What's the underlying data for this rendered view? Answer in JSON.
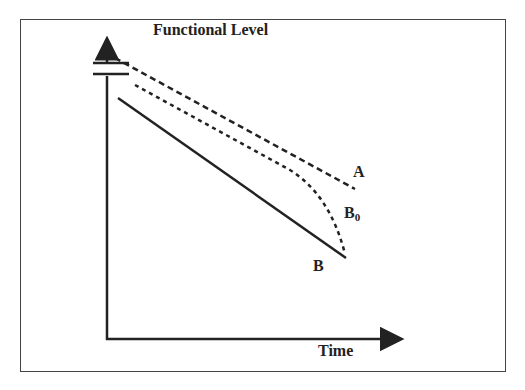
{
  "diagram": {
    "y_axis_label": "Functional Level",
    "x_axis_label": "Time",
    "axis_break": true,
    "curves": [
      {
        "label": "A",
        "style": "dashed",
        "description": "upper dashed line, linear decline"
      },
      {
        "label_main": "B",
        "label_sub": "0",
        "style": "dotted/dashed",
        "description": "middle dashed curve, declines then drops steeply"
      },
      {
        "label": "B",
        "style": "solid",
        "description": "lower solid line, linear decline"
      }
    ],
    "colors": {
      "line": "#222222",
      "frame": "#444444",
      "background": "#ffffff"
    }
  }
}
